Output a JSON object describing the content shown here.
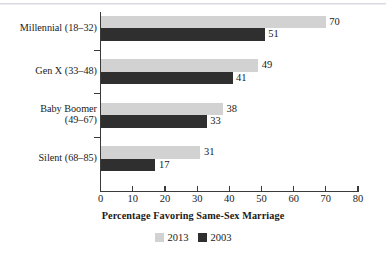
{
  "chart_data": {
    "type": "bar",
    "orientation": "horizontal",
    "title": "",
    "xlabel": "Percentage Favoring Same-Sex Marriage",
    "ylabel": "",
    "xlim": [
      0,
      80
    ],
    "xticks": [
      0,
      10,
      20,
      30,
      40,
      50,
      60,
      70,
      80
    ],
    "grid": false,
    "legend_position": "bottom",
    "categories": [
      "Millennial (18–32)",
      "Gen X (33–48)",
      "Baby Boomer\n(49–67)",
      "Silent (68–85)"
    ],
    "series": [
      {
        "name": "2013",
        "color": "#d2d2d2",
        "values": [
          70,
          49,
          38,
          31
        ]
      },
      {
        "name": "2003",
        "color": "#2f2f2f",
        "values": [
          51,
          41,
          33,
          17
        ]
      }
    ]
  },
  "axis": {
    "x_tick_labels": [
      "0",
      "10",
      "20",
      "30",
      "40",
      "50",
      "60",
      "70",
      "80"
    ],
    "x_title": "Percentage Favoring Same-Sex Marriage"
  },
  "legend": {
    "items": [
      {
        "label": "2013",
        "color": "#d2d2d2"
      },
      {
        "label": "2003",
        "color": "#2f2f2f"
      }
    ]
  },
  "groups": [
    {
      "label": "Millennial (18–32)",
      "bars": [
        {
          "series": "2013",
          "value": 70,
          "value_label": "70"
        },
        {
          "series": "2003",
          "value": 51,
          "value_label": "51"
        }
      ]
    },
    {
      "label": "Gen X (33–48)",
      "bars": [
        {
          "series": "2013",
          "value": 49,
          "value_label": "49"
        },
        {
          "series": "2003",
          "value": 41,
          "value_label": "41"
        }
      ]
    },
    {
      "label": "Baby Boomer\n(49–67)",
      "bars": [
        {
          "series": "2013",
          "value": 38,
          "value_label": "38"
        },
        {
          "series": "2003",
          "value": 33,
          "value_label": "33"
        }
      ]
    },
    {
      "label": "Silent (68–85)",
      "bars": [
        {
          "series": "2013",
          "value": 31,
          "value_label": "31"
        },
        {
          "series": "2003",
          "value": 17,
          "value_label": "17"
        }
      ]
    }
  ]
}
